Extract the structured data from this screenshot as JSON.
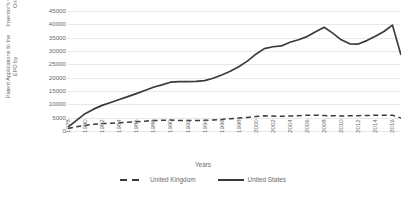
{
  "chart_data": {
    "type": "line",
    "title": "",
    "xlabel": "Years",
    "ylabel": "Patent Applications to the EPO by Inventor's Country of Origin",
    "ylabel_line1": "Patent Applications to the EPO by",
    "ylabel_line2": "Inventor's Country of Origin",
    "ylim": [
      0,
      45000
    ],
    "ytick_step": 5000,
    "yticks": [
      45000,
      40000,
      35000,
      30000,
      25000,
      20000,
      15000,
      10000,
      5000,
      0
    ],
    "ytick_labels": [
      "45000",
      "40000",
      "35000",
      "30000",
      "25000",
      "20000",
      "15000",
      "10000",
      "5000",
      "0"
    ],
    "grid": true,
    "grid_axis": "y",
    "legend_position": "bottom",
    "x_start": 1978,
    "x_end": 2017,
    "xtick_labels": [
      "1978",
      "1980",
      "1982",
      "1984",
      "1986",
      "1988",
      "1990",
      "1992",
      "1994",
      "1996",
      "1998",
      "2000",
      "2002",
      "2004",
      "2006",
      "2008",
      "2010",
      "2012",
      "2014",
      "2016"
    ],
    "x": [
      1978,
      1979,
      1980,
      1981,
      1982,
      1983,
      1984,
      1985,
      1986,
      1987,
      1988,
      1989,
      1990,
      1991,
      1992,
      1993,
      1994,
      1995,
      1996,
      1997,
      1998,
      1999,
      2000,
      2001,
      2002,
      2003,
      2004,
      2005,
      2006,
      2007,
      2008,
      2009,
      2010,
      2011,
      2012,
      2013,
      2014,
      2015,
      2016,
      2017
    ],
    "series": [
      {
        "name": "United Kingdom",
        "style": "dashed",
        "color": "#3a3a3a",
        "values": [
          900,
          1600,
          2100,
          2500,
          2800,
          2900,
          3100,
          3300,
          3500,
          3700,
          3900,
          4000,
          4100,
          3950,
          3900,
          3950,
          4000,
          4150,
          4350,
          4600,
          4850,
          5100,
          5450,
          5700,
          5600,
          5500,
          5600,
          5750,
          5950,
          5900,
          5800,
          5700,
          5650,
          5700,
          5750,
          5800,
          5900,
          5950,
          5900,
          4900
        ]
      },
      {
        "name": "United States",
        "style": "solid",
        "color": "#3a3a3a",
        "values": [
          1500,
          4000,
          6500,
          8200,
          9600,
          10700,
          11800,
          12900,
          14000,
          15200,
          16400,
          17300,
          18300,
          18500,
          18500,
          18600,
          18900,
          19800,
          21000,
          22400,
          24100,
          26200,
          28800,
          30900,
          31600,
          31900,
          33300,
          34200,
          35400,
          37200,
          38900,
          36700,
          34200,
          32700,
          32600,
          33900,
          35500,
          37300,
          39700,
          35500
        ]
      }
    ],
    "series_note_last_visible_drop": "sharp decline at final point to ~28500",
    "us_final_value": 28500
  },
  "legend": {
    "entries": [
      {
        "label": "United Kingdom",
        "style": "dashed"
      },
      {
        "label": "United States",
        "style": "solid"
      }
    ]
  },
  "axis": {
    "x_title": "Years"
  }
}
